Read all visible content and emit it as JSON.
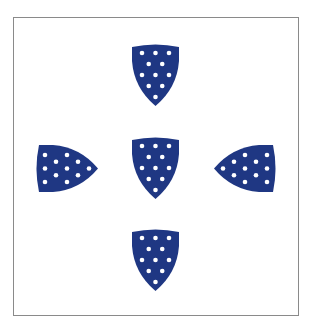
{
  "figure": {
    "shield_color": "#1f3783",
    "dot_color": "#ffffff",
    "border_color": "#8a8a8a",
    "dots_per_shield": 11,
    "dot_rows": [
      3,
      2,
      3,
      2,
      1
    ],
    "shields": [
      {
        "id": "top",
        "orientation": "point-down"
      },
      {
        "id": "left",
        "orientation": "point-right"
      },
      {
        "id": "center",
        "orientation": "point-down"
      },
      {
        "id": "right",
        "orientation": "point-left"
      },
      {
        "id": "bottom",
        "orientation": "point-down"
      }
    ]
  }
}
